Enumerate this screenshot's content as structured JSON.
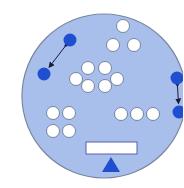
{
  "diagram": {
    "colors": {
      "background": "#ffffff",
      "disk_fill": "#a8bfec",
      "disk_stroke": "#7a86a0",
      "white_ball_fill": "#ffffff",
      "white_ball_stroke": "#6d7a95",
      "blue_ball_fill": "#1f4fd0",
      "arrow": "#1a1a40",
      "plate_fill": "#ffffff",
      "plate_stroke": "#5a5fb0",
      "pivot_fill": "#1f4fd0"
    },
    "disk": {
      "cx": 104,
      "cy": 96,
      "r": 82
    },
    "white_groups": [
      {
        "name": "top-triangle",
        "balls": [
          [
            123,
            26
          ],
          [
            113,
            45
          ],
          [
            134,
            45
          ]
        ]
      },
      {
        "name": "center-cluster",
        "balls": [
          [
            88,
            68
          ],
          [
            105,
            68
          ],
          [
            76,
            79
          ],
          [
            117,
            79
          ],
          [
            88,
            86
          ],
          [
            105,
            86
          ]
        ]
      },
      {
        "name": "left-square",
        "balls": [
          [
            53,
            113
          ],
          [
            69,
            113
          ],
          [
            53,
            131
          ],
          [
            69,
            131
          ]
        ]
      },
      {
        "name": "right-row",
        "balls": [
          [
            121,
            114
          ],
          [
            137,
            114
          ],
          [
            153,
            114
          ]
        ]
      }
    ],
    "blue_pairs": [
      {
        "name": "left-pair",
        "balls": [
          [
            70,
            40
          ],
          [
            44,
            74
          ]
        ]
      },
      {
        "name": "right-pair",
        "balls": [
          [
            177,
            78
          ],
          [
            179,
            112
          ]
        ]
      }
    ],
    "ball_radius": 6.5,
    "balance": {
      "plate": {
        "x": 86,
        "y": 142,
        "w": 51,
        "h": 12
      },
      "pivot": [
        [
          111,
          157
        ],
        [
          102,
          172
        ],
        [
          120,
          172
        ]
      ]
    }
  }
}
